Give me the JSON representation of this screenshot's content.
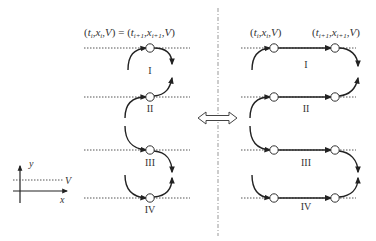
{
  "diagram": {
    "left_panel": {
      "header": "(t_i, x_i, V) = (t_{i+1}, x_{i+1}, V)",
      "header_parts": {
        "lhs": "(t",
        "lhs_i": "i",
        "sep1": ",x",
        "sep2": ",V) = (t",
        "i1": "i+1",
        "x2": ",x",
        "end": ",V)"
      },
      "segments": [
        "I",
        "II",
        "III",
        "IV"
      ]
    },
    "right_panel": {
      "label_start": "(t_i, x_i, V)",
      "label_end": "(t_{i+1}, x_{i+1}, V)",
      "segments": [
        "I",
        "II",
        "III",
        "IV"
      ]
    },
    "equivalence_symbol": "double-arrow",
    "axes": {
      "y_label": "y",
      "x_label": "x",
      "level_label": "V"
    },
    "colors": {
      "line": "#222222",
      "dotted": "#555555",
      "divider": "#999999",
      "text": "#333333"
    }
  }
}
